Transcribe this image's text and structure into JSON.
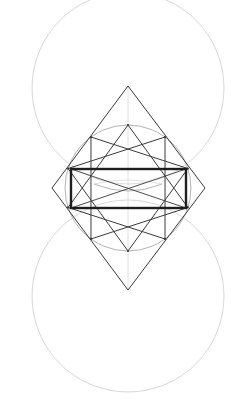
{
  "diagram": {
    "type": "geometric-construction",
    "width": 242,
    "height": 420,
    "background": "#ffffff",
    "colors": {
      "faint": "#d8d8d8",
      "guide": "#b4b4b4",
      "line": "#3a3a3a",
      "bold": "#1e1e1e"
    },
    "center": [
      128,
      188
    ],
    "large_circles": [
      {
        "name": "upper",
        "cx": 128,
        "cy": 88,
        "r": 96
      },
      {
        "name": "lower",
        "cx": 128,
        "cy": 296,
        "r": 96
      }
    ],
    "middle_circle": {
      "cx": 128,
      "cy": 188,
      "r": 63
    },
    "diamond": {
      "top": [
        128,
        86
      ],
      "right": [
        205,
        188
      ],
      "bottom": [
        128,
        290
      ],
      "left": [
        52,
        188
      ]
    },
    "star": {
      "points": 10,
      "step": 3,
      "cx": 128,
      "cy": 188,
      "r": 63
    },
    "rectangle": {
      "x": 71,
      "y": 169,
      "width": 115,
      "height": 39
    },
    "inner_lens": {
      "cx": 128,
      "cy": 188,
      "rx": 34,
      "ry": 10
    }
  }
}
